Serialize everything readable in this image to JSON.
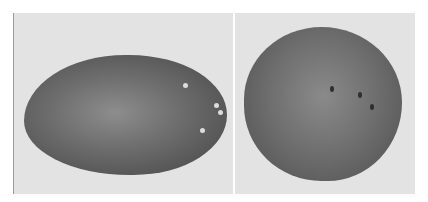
{
  "image": {
    "description": "Black-and-white photograph of two potatoes on a light background, side by side in two panels",
    "panels": [
      {
        "subject": "elongated oval potato with sprouting eyes"
      },
      {
        "subject": "round potato with dark eyes"
      }
    ],
    "colors": {
      "background": "#e3e3e3",
      "potato": "#6e6e6e"
    }
  }
}
